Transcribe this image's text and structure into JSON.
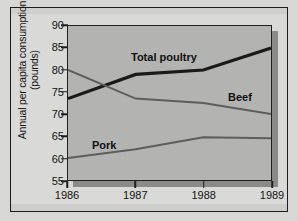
{
  "chart_data": {
    "type": "line",
    "title": "",
    "xlabel": "",
    "ylabel": "Annual per capita consumption\n(pounds)",
    "x": [
      "1986",
      "1987",
      "1988",
      "1989"
    ],
    "categories": [
      "1986",
      "1987",
      "1988",
      "1989"
    ],
    "xtick_labels": [
      "1986",
      "1987",
      "1988",
      "1989"
    ],
    "ytick_labels": [
      "90",
      "85",
      "80",
      "75",
      "70",
      "65",
      "60",
      "55"
    ],
    "ytick_values": [
      90,
      85,
      80,
      75,
      70,
      65,
      60,
      55
    ],
    "ylim": [
      55,
      90
    ],
    "grid": false,
    "legend_position": "inline-labels",
    "series": [
      {
        "name": "Total poultry",
        "label": "Total poultry",
        "color": "#1a1a1a",
        "width": 3.2,
        "values": [
          73.5,
          79,
          80,
          85
        ]
      },
      {
        "name": "Beef",
        "label": "Beef",
        "color": "#5d5d5b",
        "width": 2,
        "values": [
          80,
          73.5,
          72.5,
          70
        ]
      },
      {
        "name": "Pork",
        "label": "Pork",
        "color": "#5d5d5b",
        "width": 2,
        "values": [
          60,
          62,
          64.7,
          64.5
        ]
      }
    ],
    "annotations": [
      {
        "name": "total-poultry-label",
        "text": "Total poultry"
      },
      {
        "name": "beef-label",
        "text": "Beef"
      },
      {
        "name": "pork-label",
        "text": "Pork"
      }
    ],
    "colors": {
      "plot_background": "#b3b3b1",
      "page_background": "#d7d7d5",
      "axis": "#1f1f1f",
      "shadow": "#8a8a88",
      "text": "#121212"
    }
  }
}
